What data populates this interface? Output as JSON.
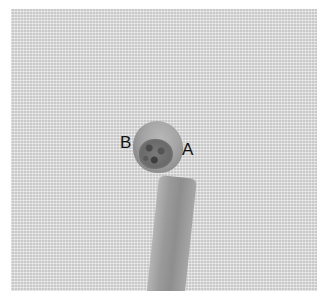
{
  "image": {
    "description": "Grayscale photograph of a small rounded specimen with a stalk on a woven fabric background",
    "background_color": "#dcdcdc",
    "border_color": "#ffffff"
  },
  "labels": {
    "b": "B",
    "a": "A"
  }
}
